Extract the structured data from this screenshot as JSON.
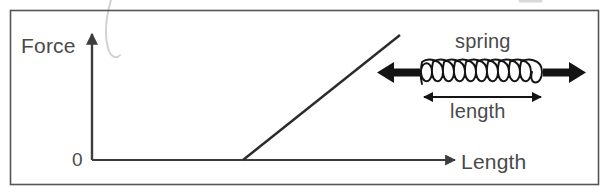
{
  "figure": {
    "kind": "force-vs-length-spring-diagram",
    "frame": {
      "color": "#555555"
    },
    "ink": {
      "axis_color": "#3d3d3d",
      "line_color": "#2b2b2b",
      "text_color": "#4a4a4a",
      "smudge_color": "#cfcfcf"
    },
    "axes": {
      "y_label": "Force",
      "x_label": "Length",
      "origin_label": "0"
    },
    "plot": {
      "description": "straight line rising from a point on the Length axis",
      "start": {
        "x": 243,
        "y": 160
      },
      "end": {
        "x": 400,
        "y": 35
      }
    },
    "spring": {
      "caption": "spring",
      "dimension_label": "length",
      "coil_count": 11,
      "left_force_arrow": "arrow-left",
      "right_force_arrow": "arrow-right"
    }
  }
}
